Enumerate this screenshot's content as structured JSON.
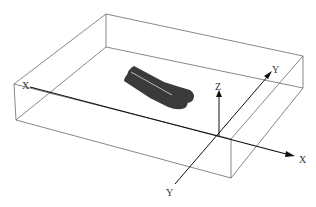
{
  "figure": {
    "axes": {
      "x_left_label": "X",
      "x_right_label": "X",
      "y_top_label": "Y",
      "y_bottom_label": "Y",
      "z_label": "Z"
    },
    "colors": {
      "box_line": "#555555",
      "axis_line": "#111111",
      "object_fill": "#3a3a3a",
      "background": "#ffffff"
    }
  }
}
